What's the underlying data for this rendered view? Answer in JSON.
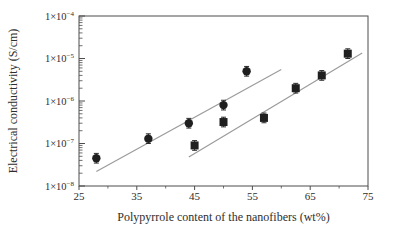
{
  "figure": {
    "background": "#ffffff",
    "text_color": "#2e2e2e",
    "axis_color": "#4d4d4d"
  },
  "chart_data": {
    "type": "scatter",
    "title": "",
    "xlabel": "Polypyrrole content of the nanofibers (wt%)",
    "ylabel": "Electrical conductivity (S/cm)",
    "grid": false,
    "legend": "none",
    "x_axis": {
      "min": 25,
      "max": 75,
      "major_ticks": [
        25,
        35,
        45,
        55,
        65,
        75
      ],
      "major_tick_labels": [
        "25",
        "35",
        "45",
        "55",
        "65",
        "75"
      ],
      "minor_ticks": [
        30,
        40,
        50,
        60,
        70
      ]
    },
    "y_axis": {
      "scale": "log",
      "min_exponent": -8,
      "max_exponent": -4,
      "tick_label_prefix": "1×10",
      "tick_exponents": [
        -4,
        -5,
        -6,
        -7,
        -8
      ]
    },
    "marker_color": "#1f1f1f",
    "error_bar_color": "#2a2a2a",
    "fit_line_color": "#9b9b9b",
    "error_bar_factor": 1.3,
    "series": [
      {
        "name": "circle series",
        "marker": "circle",
        "points": [
          [
            28,
            4.5e-08
          ],
          [
            37,
            1.3e-07
          ],
          [
            44,
            3e-07
          ],
          [
            50,
            8e-07
          ],
          [
            54,
            5e-06
          ]
        ],
        "fit_line": [
          [
            28,
            2.2e-08
          ],
          [
            60,
            5.5e-06
          ]
        ]
      },
      {
        "name": "square series",
        "marker": "square",
        "points": [
          [
            45,
            9e-08
          ],
          [
            50,
            3.2e-07
          ],
          [
            57,
            4e-07
          ],
          [
            62.5,
            2e-06
          ],
          [
            67,
            4e-06
          ],
          [
            71.5,
            1.3e-05
          ]
        ],
        "fit_line": [
          [
            44,
            4.8e-08
          ],
          [
            74,
            1.35e-05
          ]
        ]
      }
    ]
  }
}
